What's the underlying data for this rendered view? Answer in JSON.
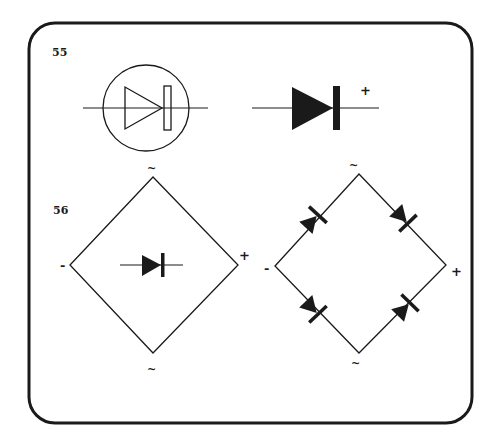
{
  "figures": {
    "fig55": {
      "label": "55",
      "symbol_a": {
        "type": "diode-in-circle",
        "style": "outline"
      },
      "symbol_b": {
        "type": "diode",
        "style": "filled",
        "terminal_label": "+"
      }
    },
    "fig56": {
      "label": "56",
      "bridge_a": {
        "type": "bridge-rectifier-compact",
        "labels": {
          "top": "~",
          "bottom": "~",
          "left": "-",
          "right": "+"
        }
      },
      "bridge_b": {
        "type": "bridge-rectifier-four-diodes",
        "labels": {
          "top": "~",
          "bottom": "~",
          "left": "-",
          "right": "+"
        }
      }
    }
  },
  "colors": {
    "ink": "#1a1a1a",
    "background": "#ffffff",
    "frame": "#1a1a1a"
  }
}
